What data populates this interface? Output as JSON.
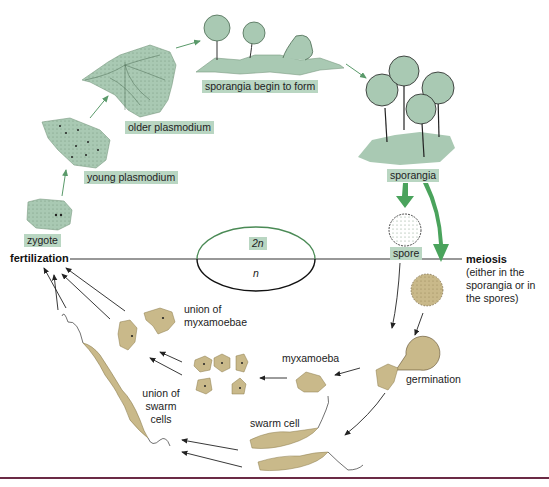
{
  "diagram": {
    "colors": {
      "diploid_fill": "#a9c9b3",
      "diploid_label_bg": "#b9d6c2",
      "haploid_fill": "#c9b98a",
      "arrow_green": "#4aa35c",
      "arrow_dark": "#222222",
      "bottom_rule": "#6b2a45"
    },
    "ploidy": {
      "upper": "2n",
      "lower": "n"
    },
    "stages_diploid": [
      {
        "id": "zygote",
        "label": "zygote"
      },
      {
        "id": "young-plasmodium",
        "label": "young plasmodium"
      },
      {
        "id": "older-plasmodium",
        "label": "older plasmodium"
      },
      {
        "id": "sporangia-begin",
        "label": "sporangia begin to form"
      },
      {
        "id": "sporangia",
        "label": "sporangia"
      },
      {
        "id": "spore",
        "label": "spore"
      }
    ],
    "stages_haploid": [
      {
        "id": "germination",
        "label": "germination"
      },
      {
        "id": "myxamoeba",
        "label": "myxamoeba"
      },
      {
        "id": "swarm-cell",
        "label": "swarm cell"
      },
      {
        "id": "union-myxamoebae",
        "label": "union of myxamoebae"
      },
      {
        "id": "union-swarm-cells",
        "label": "union of swarm cells"
      }
    ],
    "events": {
      "fertilization": "fertilization",
      "meiosis": "meiosis",
      "meiosis_note": "(either in the sporangia or in the spores)"
    }
  }
}
